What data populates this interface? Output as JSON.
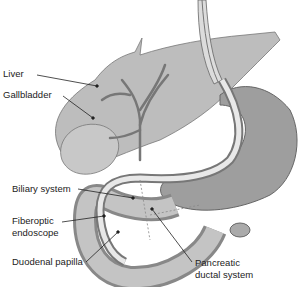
{
  "diagram": {
    "labels": {
      "liver": "Liver",
      "gallbladder": "Gallbladder",
      "biliary_system": "Biliary system",
      "fiberoptic_line1": "Fiberoptic",
      "fiberoptic_line2": "endoscope",
      "duodenal_papilla": "Duodenal papilla",
      "pancreatic_line1": "Pancreatic",
      "pancreatic_line2": "ductal system"
    },
    "colors": {
      "organ_fill": "#b8b8b8",
      "organ_dark": "#8f8f8f",
      "outline": "#6a6a6a",
      "background": "#ffffff",
      "text": "#222222"
    }
  }
}
